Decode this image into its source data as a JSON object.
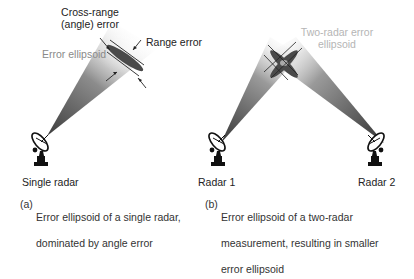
{
  "panel_a": {
    "labels": {
      "cross_range": "Cross-range\n(angle) error",
      "cross_range_line1": "Cross-range",
      "cross_range_line2": "(angle) error",
      "range_error": "Range error",
      "error_ellipsoid": "Error ellipsoid",
      "radar": "Single radar"
    },
    "caption": {
      "tag": "(a)",
      "line1": "Error ellipsoid of a single radar,",
      "line2": "dominated by angle error"
    }
  },
  "panel_b": {
    "labels": {
      "two_radar_line1": "Two-radar error",
      "two_radar_line2": "ellipsoid",
      "radar1": "Radar 1",
      "radar2": "Radar 2"
    },
    "caption": {
      "tag": "(b)",
      "line1": "Error ellipsoid of a two-radar",
      "line2": "measurement, resulting in smaller",
      "line3": "error ellipsoid"
    }
  },
  "colors": {
    "beam_dark": "#3a3a3a",
    "ellipse": "#4a4a4a",
    "small_ellipse": "#9a9a9a",
    "label_grey": "#8a8a8a",
    "label_light": "#b5b5b5"
  },
  "icons": [
    "radar-dish-icon"
  ]
}
